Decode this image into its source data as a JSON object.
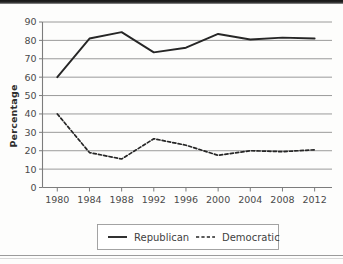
{
  "chart_data": {
    "type": "line",
    "title": "",
    "xlabel": "",
    "ylabel": "Percentage",
    "x": [
      1980,
      1984,
      1988,
      1992,
      1996,
      2000,
      2004,
      2008,
      2012
    ],
    "xticklabels": [
      "1980",
      "1984",
      "1988",
      "1992",
      "1996",
      "2000",
      "2004",
      "2008",
      "2012"
    ],
    "yticklabels": [
      "0",
      "10",
      "20",
      "30",
      "40",
      "50",
      "60",
      "70",
      "80",
      "90"
    ],
    "yticks": [
      0,
      10,
      20,
      30,
      40,
      50,
      60,
      70,
      80,
      90
    ],
    "ylim": [
      0,
      90
    ],
    "grid": "horizontal",
    "legend_position": "bottom-center",
    "series": [
      {
        "name": "Republican",
        "style": "solid",
        "color": "#262626",
        "values": [
          60,
          81,
          84.5,
          73.5,
          76,
          83.5,
          80.5,
          81.5,
          81
        ]
      },
      {
        "name": "Democratic",
        "style": "dashed",
        "color": "#262626",
        "values": [
          40,
          19,
          15.5,
          26.5,
          23,
          17.5,
          20,
          19.5,
          20.5
        ]
      }
    ]
  },
  "legend": {
    "items": [
      {
        "label": "Republican",
        "style": "solid"
      },
      {
        "label": "Democratic",
        "style": "dashed"
      }
    ]
  },
  "axis": {
    "y_title": "Percentage"
  }
}
